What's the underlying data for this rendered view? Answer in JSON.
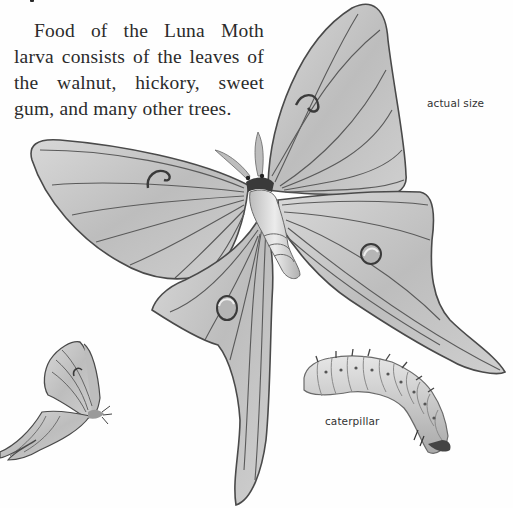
{
  "text": {
    "lines": [
      "Food of the Luna Moth",
      "larva consists of the leaves of",
      "the walnut, hickory, sweet",
      "gum, and many other trees."
    ]
  },
  "captions": {
    "actual_size": "actual size",
    "caterpillar": "caterpillar"
  },
  "illustrations": [
    {
      "name": "luna-moth-adult",
      "description": "Large Luna Moth with wings spread, drawn at actual size"
    },
    {
      "name": "luna-moth-side-view",
      "description": "Small Luna Moth viewed from the side, wings folded"
    },
    {
      "name": "luna-moth-caterpillar",
      "description": "Segmented Luna Moth caterpillar with small spines"
    }
  ],
  "colors": {
    "background": "#fefefe",
    "text": "#2b2b2b",
    "wing_fill": "#c9c9c9",
    "wing_vein": "#555555"
  }
}
